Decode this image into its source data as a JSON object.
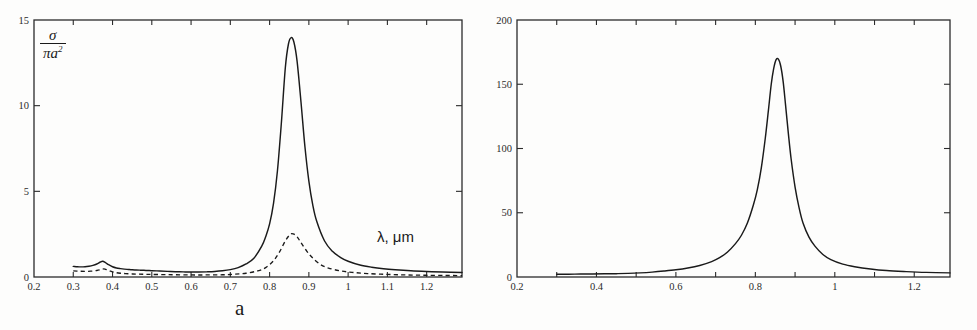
{
  "figure": {
    "background": "#fdfdfc",
    "ink": "#1a1a1a",
    "panel_letters": {
      "a": "a",
      "b": "b"
    }
  },
  "panels": [
    {
      "id": "a",
      "letter": "a",
      "ylabel_numerator": "σ",
      "ylabel_denominator": "πa",
      "ylabel_denominator_exp": "2",
      "xlabel": "λ, μm",
      "geom": {
        "left": 34,
        "right": 462,
        "top": 20,
        "bottom": 277
      }
    },
    {
      "id": "b",
      "letter": "b",
      "ylabel_base": "|F|",
      "ylabel_exp": "2",
      "xlabel": "λ, μm",
      "geom": {
        "left": 517,
        "right": 950,
        "top": 20,
        "bottom": 277
      }
    }
  ],
  "chart_data": [
    {
      "type": "line",
      "panel": "a",
      "title": "",
      "xlabel": "λ, μm",
      "ylabel": "σ / πa²",
      "xlim": [
        0.2,
        1.29
      ],
      "ylim": [
        0,
        15
      ],
      "xticks": [
        0.2,
        0.3,
        0.4,
        0.5,
        0.6,
        0.7,
        0.8,
        0.9,
        1.0,
        1.1,
        1.2
      ],
      "xticklabels": [
        "0.2",
        "0.3",
        "0.4",
        "0.5",
        "0.6",
        "0.7",
        "0.8",
        "0.9",
        "1",
        "1.1",
        "1.2"
      ],
      "yticks": [
        0,
        5,
        10,
        15
      ],
      "yticklabels": [
        "0",
        "5",
        "10",
        "15"
      ],
      "grid": false,
      "legend": "none",
      "series": [
        {
          "name": "extinction efficiency (solid)",
          "style": "solid",
          "x": [
            0.3,
            0.31,
            0.32,
            0.33,
            0.34,
            0.35,
            0.36,
            0.368,
            0.375,
            0.382,
            0.39,
            0.4,
            0.41,
            0.42,
            0.43,
            0.44,
            0.45,
            0.46,
            0.47,
            0.48,
            0.49,
            0.5,
            0.52,
            0.54,
            0.56,
            0.58,
            0.6,
            0.62,
            0.64,
            0.66,
            0.68,
            0.7,
            0.72,
            0.74,
            0.76,
            0.78,
            0.79,
            0.8,
            0.81,
            0.82,
            0.83,
            0.84,
            0.848,
            0.855,
            0.862,
            0.87,
            0.88,
            0.89,
            0.9,
            0.91,
            0.92,
            0.94,
            0.96,
            0.98,
            1.0,
            1.03,
            1.06,
            1.09,
            1.12,
            1.16,
            1.2,
            1.24,
            1.29
          ],
          "y": [
            0.62,
            0.6,
            0.59,
            0.6,
            0.63,
            0.68,
            0.76,
            0.86,
            0.92,
            0.84,
            0.72,
            0.6,
            0.53,
            0.49,
            0.46,
            0.44,
            0.42,
            0.41,
            0.4,
            0.39,
            0.38,
            0.37,
            0.35,
            0.33,
            0.31,
            0.3,
            0.29,
            0.29,
            0.3,
            0.32,
            0.36,
            0.43,
            0.55,
            0.76,
            1.1,
            1.8,
            2.35,
            3.1,
            4.3,
            6.2,
            9.0,
            12.2,
            13.6,
            13.97,
            13.7,
            12.6,
            10.2,
            7.6,
            5.6,
            4.2,
            3.25,
            2.1,
            1.5,
            1.15,
            0.92,
            0.7,
            0.57,
            0.48,
            0.42,
            0.36,
            0.32,
            0.29,
            0.26
          ],
          "peak": {
            "x": 0.855,
            "y": 14.0
          },
          "shoulder_peak": {
            "x": 0.375,
            "y": 0.92
          }
        },
        {
          "name": "absorption efficiency (dashed)",
          "style": "dashed",
          "x": [
            0.3,
            0.315,
            0.33,
            0.345,
            0.36,
            0.37,
            0.378,
            0.386,
            0.395,
            0.405,
            0.42,
            0.44,
            0.46,
            0.48,
            0.5,
            0.53,
            0.56,
            0.6,
            0.64,
            0.68,
            0.71,
            0.74,
            0.77,
            0.79,
            0.81,
            0.825,
            0.84,
            0.852,
            0.86,
            0.87,
            0.88,
            0.895,
            0.91,
            0.93,
            0.95,
            0.98,
            1.01,
            1.05,
            1.1,
            1.15,
            1.2,
            1.25,
            1.29
          ],
          "y": [
            0.36,
            0.34,
            0.33,
            0.34,
            0.38,
            0.43,
            0.47,
            0.42,
            0.34,
            0.27,
            0.22,
            0.19,
            0.17,
            0.16,
            0.15,
            0.14,
            0.13,
            0.12,
            0.12,
            0.13,
            0.16,
            0.22,
            0.36,
            0.55,
            0.95,
            1.45,
            2.1,
            2.48,
            2.52,
            2.35,
            2.0,
            1.5,
            1.1,
            0.72,
            0.52,
            0.36,
            0.27,
            0.2,
            0.15,
            0.12,
            0.1,
            0.09,
            0.08
          ],
          "peak": {
            "x": 0.857,
            "y": 2.52
          },
          "shoulder_peak": {
            "x": 0.378,
            "y": 0.47
          }
        }
      ]
    },
    {
      "type": "line",
      "panel": "b",
      "title": "",
      "xlabel": "λ, μm",
      "ylabel": "|F|²",
      "xlim": [
        0.2,
        1.29
      ],
      "ylim": [
        0,
        200
      ],
      "xticks": [
        0.2,
        0.4,
        0.6,
        0.8,
        1.0,
        1.2
      ],
      "xticklabels": [
        "0.2",
        "0.4",
        "0.6",
        "0.8",
        "1",
        "1.2"
      ],
      "xminorticks": [
        0.3,
        0.5,
        0.7,
        0.9,
        1.1
      ],
      "yticks": [
        0,
        50,
        100,
        150,
        200
      ],
      "yticklabels": [
        "0",
        "50",
        "100",
        "150",
        "200"
      ],
      "grid": false,
      "legend": "none",
      "series": [
        {
          "name": "field enhancement (solid)",
          "style": "solid",
          "x": [
            0.3,
            0.33,
            0.36,
            0.39,
            0.42,
            0.45,
            0.48,
            0.51,
            0.54,
            0.57,
            0.6,
            0.63,
            0.66,
            0.69,
            0.71,
            0.73,
            0.75,
            0.765,
            0.78,
            0.795,
            0.805,
            0.815,
            0.825,
            0.833,
            0.84,
            0.846,
            0.852,
            0.858,
            0.864,
            0.87,
            0.876,
            0.883,
            0.89,
            0.9,
            0.91,
            0.92,
            0.935,
            0.95,
            0.97,
            0.99,
            1.02,
            1.05,
            1.09,
            1.13,
            1.18,
            1.23,
            1.29
          ],
          "y": [
            2.2,
            2.2,
            2.3,
            2.4,
            2.5,
            2.6,
            2.8,
            3.2,
            3.8,
            4.6,
            5.6,
            7.0,
            9.0,
            12.0,
            15.0,
            19.5,
            26.0,
            32.5,
            42.0,
            56.0,
            68.0,
            85.0,
            108.0,
            130.0,
            150.0,
            162.0,
            169.0,
            169.5,
            164.0,
            152.0,
            134.0,
            112.0,
            92.0,
            70.0,
            54.0,
            42.0,
            31.0,
            24.0,
            17.5,
            13.5,
            10.0,
            8.0,
            6.2,
            5.0,
            4.2,
            3.6,
            3.2
          ],
          "peak": {
            "x": 0.855,
            "y": 170.0
          }
        }
      ]
    }
  ]
}
